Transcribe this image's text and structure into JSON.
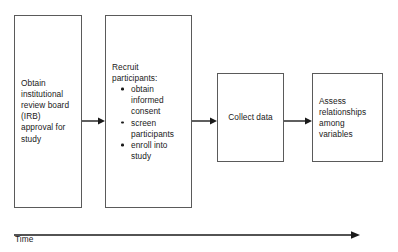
{
  "diagram": {
    "colors": {
      "box_border": "#5a5a5a",
      "text": "#1a1a1a",
      "arrow": "#1a1a1a",
      "background": "#ffffff"
    },
    "boxes": [
      {
        "id": "irb-approval",
        "name": "obtain-irb-approval-box",
        "text": "Obtain institutional review board (IRB) approval for study",
        "bullets": []
      },
      {
        "id": "recruit-participants",
        "name": "recruit-participants-box",
        "text": "Recruit participants:",
        "bullets": [
          "obtain informed consent",
          "screen participants",
          "enroll into study"
        ]
      },
      {
        "id": "collect-data",
        "name": "collect-data-box",
        "text": "Collect data",
        "bullets": []
      },
      {
        "id": "assess-relationships",
        "name": "assess-relationships-box",
        "text": "Assess relationships among variables",
        "bullets": []
      }
    ],
    "connectors": [
      {
        "from": "irb-approval",
        "to": "recruit-participants"
      },
      {
        "from": "recruit-participants",
        "to": "collect-data"
      },
      {
        "from": "collect-data",
        "to": "assess-relationships"
      }
    ],
    "axis": {
      "label": "Time",
      "direction": "left-to-right"
    }
  }
}
